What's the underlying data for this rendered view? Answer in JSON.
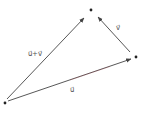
{
  "diagram": {
    "points": [
      {
        "id": "A",
        "label": ""
      },
      {
        "id": "B",
        "label": ""
      },
      {
        "id": "C",
        "label": ""
      }
    ],
    "vectors": [
      {
        "id": "u",
        "from": "A",
        "to": "B",
        "label": "u⃗"
      },
      {
        "id": "v",
        "from": "B",
        "to": "C",
        "label": "v⃗"
      },
      {
        "id": "sum",
        "from": "A",
        "to": "C",
        "label": "u⃗+v⃗"
      }
    ],
    "colors": {
      "stroke": "#444444",
      "point": "#222222",
      "accent": "#d04050"
    }
  }
}
